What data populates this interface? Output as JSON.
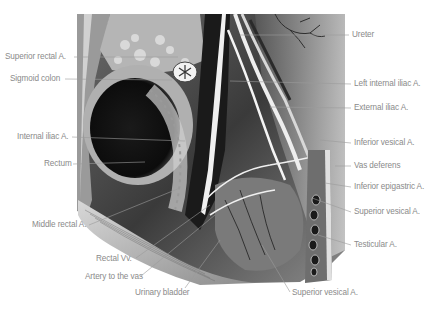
{
  "figure": {
    "labels_left": [
      {
        "id": "superior-rectal-a",
        "text": "Superior rectal A.",
        "x": 5,
        "y": 53
      },
      {
        "id": "sigmoid-colon",
        "text": "Sigmoid colon",
        "x": 10,
        "y": 75
      },
      {
        "id": "internal-iliac-a",
        "text": "Internal iliac A.",
        "x": 17,
        "y": 133
      },
      {
        "id": "rectum",
        "text": "Rectum",
        "x": 44,
        "y": 160
      },
      {
        "id": "middle-rectal-a",
        "text": "Middle rectal A.",
        "x": 32,
        "y": 222
      },
      {
        "id": "rectal-vv",
        "text": "Rectal Vv.",
        "x": 96,
        "y": 256
      },
      {
        "id": "artery-to-the-vas",
        "text": "Artery to the vas",
        "x": 85,
        "y": 275
      },
      {
        "id": "urinary-bladder",
        "text": "Urinary bladder",
        "x": 135,
        "y": 290
      }
    ],
    "labels_right": [
      {
        "id": "ureter",
        "text": "Ureter",
        "x": 352,
        "y": 31
      },
      {
        "id": "left-internal-iliac-a",
        "text": "Left internal iliac A.",
        "x": 354,
        "y": 80
      },
      {
        "id": "external-iliac-a",
        "text": "External iliac A.",
        "x": 354,
        "y": 104
      },
      {
        "id": "inferior-vesical-a",
        "text": "Inferior vesical A.",
        "x": 354,
        "y": 139
      },
      {
        "id": "vas-deferens",
        "text": "Vas deferens",
        "x": 354,
        "y": 162
      },
      {
        "id": "inferior-epigastric-a",
        "text": "Inferior epigastric A.",
        "x": 354,
        "y": 183
      },
      {
        "id": "superior-vesical-a-right",
        "text": "Superior vesical A.",
        "x": 354,
        "y": 208
      },
      {
        "id": "testicular-a",
        "text": "Testicular A.",
        "x": 354,
        "y": 241
      },
      {
        "id": "superior-vesical-a-bottom",
        "text": "Superior vesical A.",
        "x": 292,
        "y": 290
      }
    ],
    "colors": {
      "label_text": "#8a8a8a",
      "leader_line": "#9a9a9a",
      "background": "#ffffff"
    }
  }
}
